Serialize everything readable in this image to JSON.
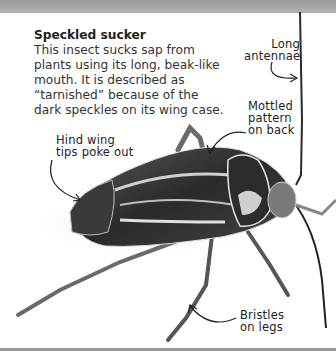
{
  "intro": {
    "title": "Speckled sucker",
    "body": "This insect sucks sap from plants using its long, beak-like mouth. It is described as “tarnished” because of the dark speckles on its wing case."
  },
  "callouts": {
    "antennae": [
      "Long",
      "antennae"
    ],
    "pattern": [
      "Mottled",
      "pattern",
      "on back"
    ],
    "wing_tips": [
      "Hind wing",
      "tips poke out"
    ],
    "bristles": [
      "Bristles",
      "on legs"
    ]
  },
  "colors": {
    "band": "#a8a8a8",
    "text": "#333333",
    "insect_dark": "#1e1e1e",
    "insect_light": "#d8d8d8"
  }
}
